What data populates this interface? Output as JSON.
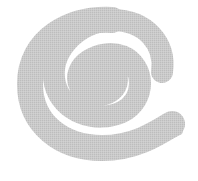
{
  "image": {
    "description": "Hand-drawn gray spiral swirl on white background",
    "label": "spiral",
    "colors": {
      "background": "#ffffff",
      "spiral_fill": "#c9c9c9",
      "texture_dot": "#b8b8b8"
    }
  }
}
